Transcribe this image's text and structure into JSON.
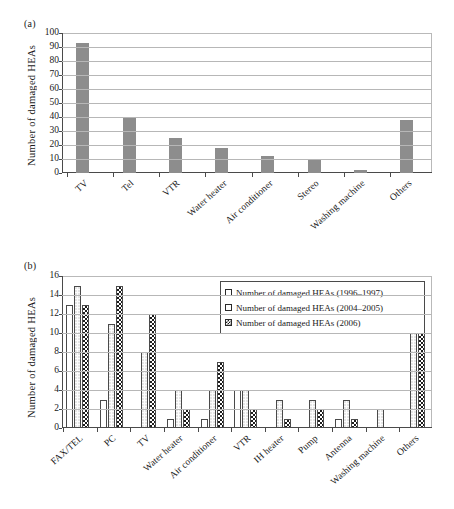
{
  "figure": {
    "panel_a_label": "(a)",
    "panel_b_label": "(b)"
  },
  "chart_data": [
    {
      "type": "bar",
      "panel": "(a)",
      "title": "",
      "xlabel": "",
      "ylabel": "Number of damaged HEAs",
      "ylim": [
        0,
        100
      ],
      "yticks": [
        0,
        10,
        20,
        30,
        40,
        50,
        60,
        70,
        80,
        90,
        100
      ],
      "grid": true,
      "legend": false,
      "bar_color": "#8d8d8d",
      "categories": [
        "TV",
        "Tel",
        "VTR",
        "Water heater",
        "Air conditioner",
        "Stereo",
        "Washing machine",
        "Others"
      ],
      "values": [
        93,
        39,
        25,
        18,
        12,
        9,
        2,
        38
      ]
    },
    {
      "type": "bar",
      "panel": "(b)",
      "title": "",
      "xlabel": "",
      "ylabel": "Number of damaged HEAs",
      "ylim": [
        0,
        16
      ],
      "yticks": [
        0,
        2,
        4,
        6,
        8,
        10,
        12,
        14,
        16
      ],
      "grid": true,
      "legend": true,
      "legend_position": "top-right",
      "categories": [
        "FAX/TEL",
        "PC",
        "TV",
        "Water heater",
        "Air conditioner",
        "VTR",
        "IH heater",
        "Pump",
        "Antenna",
        "Washing machine",
        "Others"
      ],
      "series": [
        {
          "name": "Number of damaged HEAs (1996–1997)",
          "fill": "empty",
          "values": [
            13,
            3,
            0,
            1,
            1,
            4,
            0,
            0,
            1,
            0,
            0
          ]
        },
        {
          "name": "Number of damaged HEAs (2004–2005)",
          "fill": "dotted",
          "values": [
            15,
            11,
            8,
            4,
            4,
            4,
            3,
            3,
            3,
            2,
            12
          ]
        },
        {
          "name": "Number of damaged HEAs (2006)",
          "fill": "checkered",
          "values": [
            13,
            15,
            12,
            2,
            7,
            2,
            1,
            2,
            1,
            0,
            10
          ]
        }
      ]
    }
  ]
}
